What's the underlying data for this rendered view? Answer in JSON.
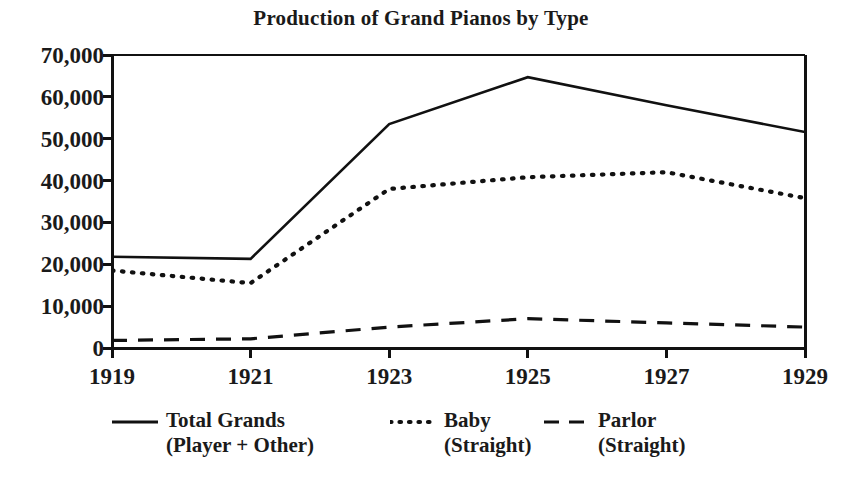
{
  "chart_data": {
    "type": "line",
    "title": "Production of Grand Pianos by Type",
    "xlabel": "",
    "ylabel": "",
    "x": [
      1919,
      1921,
      1923,
      1925,
      1927,
      1929
    ],
    "xtick_labels": [
      "1919",
      "1921",
      "1923",
      "1925",
      "1927",
      "1929"
    ],
    "ytick_labels": [
      "70,000",
      "60,000",
      "50,000",
      "40,000",
      "30,000",
      "20,000",
      "10,000",
      "0"
    ],
    "yticks": [
      70000,
      60000,
      50000,
      40000,
      30000,
      20000,
      10000,
      0
    ],
    "xlim": [
      1919,
      1929
    ],
    "ylim": [
      0,
      70000
    ],
    "grid": false,
    "legend_position": "below",
    "series": [
      {
        "name": "Total Grands",
        "sublabel": "(Player + Other)",
        "style": "solid",
        "color": "#111111",
        "values": [
          21800,
          21300,
          53500,
          64700,
          58000,
          51600
        ]
      },
      {
        "name": "Baby",
        "sublabel": "(Straight)",
        "style": "dotted",
        "color": "#111111",
        "values": [
          18500,
          15500,
          38000,
          40800,
          42000,
          35800
        ]
      },
      {
        "name": "Parlor",
        "sublabel": "(Straight)",
        "style": "dashed",
        "color": "#111111",
        "values": [
          1800,
          2200,
          5000,
          7000,
          6000,
          5000
        ]
      }
    ]
  },
  "legend": {
    "entries": [
      {
        "label": "Total Grands",
        "sublabel": "(Player + Other)"
      },
      {
        "label": "Baby",
        "sublabel": "(Straight)"
      },
      {
        "label": "Parlor",
        "sublabel": "(Straight)"
      }
    ]
  },
  "colors": {
    "ink": "#111111",
    "background": "#ffffff"
  }
}
